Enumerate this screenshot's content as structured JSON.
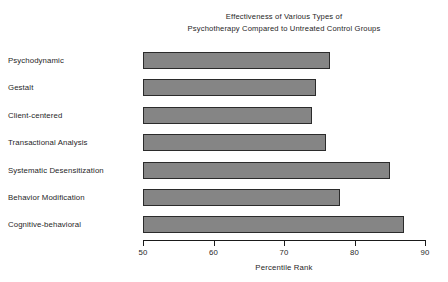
{
  "chart_data": {
    "type": "bar",
    "orientation": "horizontal",
    "title": "Effectiveness of Various Types of Psychotherapy Compared to Untreated Control Groups",
    "title_lines": [
      "Effectiveness of Various Types of",
      "Psychotherapy Compared to Untreated Control Groups"
    ],
    "xlabel": "Percentile Rank",
    "ylabel": "",
    "xlim": [
      50,
      90
    ],
    "xticks": [
      50,
      60,
      70,
      80,
      90
    ],
    "xtick_labels": [
      "50",
      "60",
      "70",
      "80",
      "90"
    ],
    "grid": false,
    "legend": false,
    "bar_color": "#858585",
    "bar_edge_color": "#2b2b2b",
    "categories": [
      "Psychodynamic",
      "Gestalt",
      "Client-centered",
      "Transactional Analysis",
      "Systematic Desensitization",
      "Behavior Modification",
      "Cognitive-behavioral"
    ],
    "values": [
      76.5,
      74.5,
      74,
      76,
      85,
      78,
      87
    ],
    "bars": [
      {
        "category": "Psychodynamic",
        "value": 76.5
      },
      {
        "category": "Gestalt",
        "value": 74.5
      },
      {
        "category": "Client-centered",
        "value": 74
      },
      {
        "category": "Transactional Analysis",
        "value": 76
      },
      {
        "category": "Systematic Desensitization",
        "value": 85
      },
      {
        "category": "Behavior Modification",
        "value": 78
      },
      {
        "category": "Cognitive-behavioral",
        "value": 87
      }
    ]
  }
}
